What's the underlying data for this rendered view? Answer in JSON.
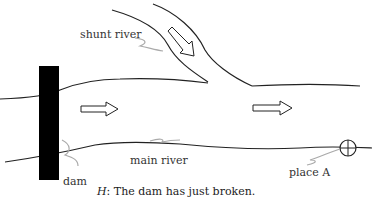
{
  "diagram": {
    "labels": {
      "shunt_river": "shunt river",
      "main_river": "main river",
      "dam": "dam",
      "place_a": "place A"
    },
    "caption": {
      "variable": "H",
      "text": ": The dam has just broken."
    },
    "colors": {
      "line": "#222222",
      "dam": "#000000",
      "pointer": "#aaaaaa",
      "text": "#333333"
    }
  }
}
